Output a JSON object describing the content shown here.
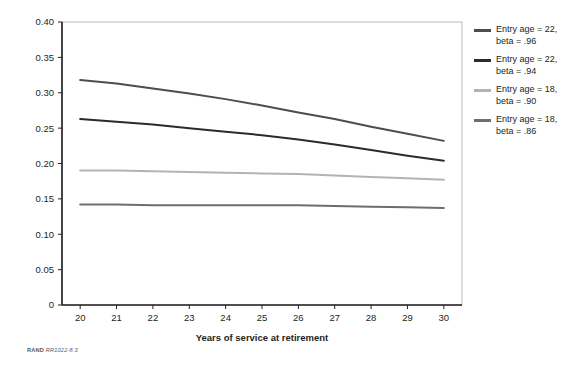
{
  "footnote": {
    "brand": "RAND",
    "figure_id": "RR1022-8.3"
  },
  "chart_data": {
    "type": "line",
    "title": "",
    "xlabel": "Years of service at retirement",
    "ylabel": "",
    "x": [
      20,
      21,
      22,
      23,
      24,
      25,
      26,
      27,
      28,
      29,
      30
    ],
    "xlim": [
      19.5,
      30.5
    ],
    "ylim": [
      0,
      0.4
    ],
    "ytick_values": [
      0,
      0.05,
      0.1,
      0.15,
      0.2,
      0.25,
      0.3,
      0.35,
      0.4
    ],
    "ytick_labels": [
      "0",
      "0.05",
      "0.10",
      "0.15",
      "0.20",
      "0.25",
      "0.30",
      "0.35",
      "0.40"
    ],
    "xtick_labels": [
      "20",
      "21",
      "22",
      "23",
      "24",
      "25",
      "26",
      "27",
      "28",
      "29",
      "30"
    ],
    "grid": false,
    "legend_position": "right",
    "series": [
      {
        "name": "Entry age = 22,\nbeta = .96",
        "color": "#4d4d4f",
        "values": [
          0.318,
          0.313,
          0.306,
          0.299,
          0.291,
          0.282,
          0.272,
          0.263,
          0.252,
          0.242,
          0.232
        ]
      },
      {
        "name": "Entry age = 22,\nbeta = .94",
        "color": "#2b2b2d",
        "values": [
          0.263,
          0.259,
          0.255,
          0.25,
          0.245,
          0.24,
          0.234,
          0.227,
          0.219,
          0.211,
          0.204
        ]
      },
      {
        "name": "Entry age = 18,\nbeta = .90",
        "color": "#b3b3b3",
        "values": [
          0.19,
          0.19,
          0.189,
          0.188,
          0.187,
          0.186,
          0.185,
          0.183,
          0.181,
          0.179,
          0.177
        ]
      },
      {
        "name": "Entry age = 18,\nbeta = .86",
        "color": "#6d6e71",
        "values": [
          0.142,
          0.142,
          0.141,
          0.141,
          0.141,
          0.141,
          0.141,
          0.14,
          0.139,
          0.138,
          0.137
        ]
      }
    ]
  },
  "legend": {
    "items": [
      {
        "label": "Entry age = 22,\nbeta = .96",
        "color": "#4d4d4f"
      },
      {
        "label": "Entry age = 22,\nbeta = .94",
        "color": "#2b2b2d"
      },
      {
        "label": "Entry age = 18,\nbeta = .90",
        "color": "#b3b3b3"
      },
      {
        "label": "Entry age = 18,\nbeta = .86",
        "color": "#6d6e71"
      }
    ]
  }
}
